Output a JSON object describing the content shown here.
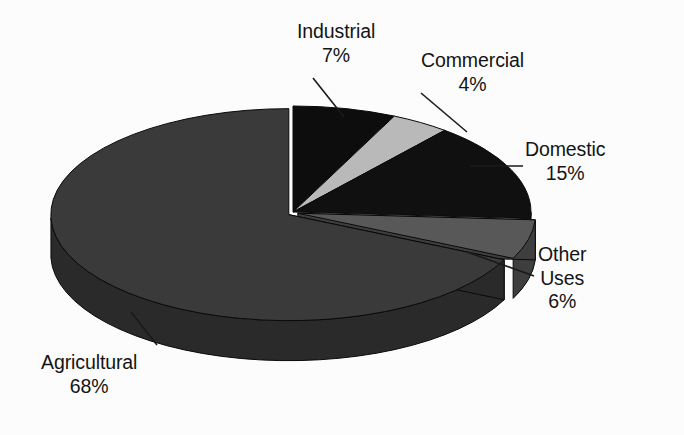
{
  "chart_data": {
    "type": "pie",
    "title": "",
    "subtitle": "",
    "xlabel": "",
    "ylabel": "",
    "legend_position": "none",
    "grid": false,
    "style": "3d-exploded-pie-grayscale",
    "units": "percent",
    "total": 100,
    "start_angle_deg": 0,
    "direction": "clockwise",
    "categories": [
      "Industrial",
      "Commercial",
      "Domestic",
      "Other Uses",
      "Agricultural"
    ],
    "values": [
      7,
      4,
      15,
      6,
      68
    ],
    "slices": [
      {
        "name": "Industrial",
        "value": 7,
        "value_label": "7%",
        "label_lines": [
          "Industrial",
          "7%"
        ],
        "color": "#0d0d0d",
        "side_color": "#050505",
        "exploded": false
      },
      {
        "name": "Commercial",
        "value": 4,
        "value_label": "4%",
        "label_lines": [
          "Commercial",
          "4%"
        ],
        "color": "#b9b9b9",
        "side_color": "#8f8f8f",
        "exploded": false
      },
      {
        "name": "Domestic",
        "value": 15,
        "value_label": "15%",
        "label_lines": [
          "Domestic",
          "15%"
        ],
        "color": "#101010",
        "side_color": "#070707",
        "exploded": false
      },
      {
        "name": "Other Uses",
        "value": 6,
        "value_label": "6%",
        "label_lines": [
          "Other",
          "Uses",
          "6%"
        ],
        "color": "#585858",
        "side_color": "#3e3e3e",
        "exploded": true
      },
      {
        "name": "Agricultural",
        "value": 68,
        "value_label": "68%",
        "label_lines": [
          "Agricultural",
          "68%"
        ],
        "color": "#3a3a3a",
        "side_color": "#2a2a2a",
        "exploded": true
      }
    ],
    "background_color": "#fcfcfc",
    "text_color": "#141414",
    "leader_line_color": "#1a1a1a"
  },
  "labels": {
    "industrial": {
      "name": "Industrial",
      "pct": "7%",
      "l1": "Industrial",
      "l2": "7%"
    },
    "commercial": {
      "name": "Commercial",
      "pct": "4%",
      "l1": "Commercial",
      "l2": "4%"
    },
    "domestic": {
      "name": "Domestic",
      "pct": "15%",
      "l1": "Domestic",
      "l2": "15%"
    },
    "other_uses": {
      "name": "Other Uses",
      "pct": "6%",
      "l1": "Other",
      "l2": "Uses",
      "l3": "6%"
    },
    "agricultural": {
      "name": "Agricultural",
      "pct": "68%",
      "l1": "Agricultural",
      "l2": "68%"
    }
  }
}
